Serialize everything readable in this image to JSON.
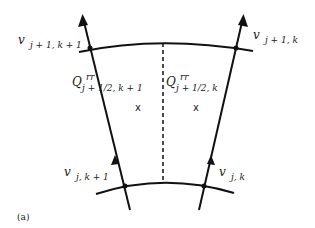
{
  "figure": {
    "caption": "(a)",
    "labels": {
      "top_left": {
        "main": "v",
        "sub": "j + 1, k + 1"
      },
      "top_right": {
        "main": "v",
        "sub": "j + 1, k"
      },
      "bottom_left": {
        "main": "v",
        "sub": "j, k + 1"
      },
      "bottom_right": {
        "main": "v",
        "sub": "j, k"
      },
      "q_left": {
        "main": "Q",
        "sup": "rr",
        "sub": "j + 1/2, k + 1"
      },
      "q_right": {
        "main": "Q",
        "sup": "rr",
        "sub": "j + 1/2, k"
      },
      "cell_center_marker": "x"
    },
    "colors": {
      "line": "#111111",
      "background": "#ffffff"
    }
  }
}
